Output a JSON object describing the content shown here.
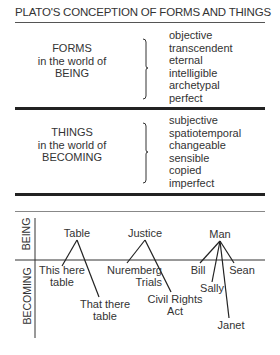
{
  "title": "PLATO'S CONCEPTION OF FORMS AND THINGS",
  "forms": {
    "label_lines": [
      "FORMS",
      "in the world of",
      "BEING"
    ],
    "attributes": [
      "objective",
      "transcendent",
      "eternal",
      "intelligible",
      "archetypal",
      "perfect"
    ]
  },
  "things": {
    "label_lines": [
      "THINGS",
      "in the world of",
      "BECOMING"
    ],
    "attributes": [
      "subjective",
      "spatiotemporal",
      "changeable",
      "sensible",
      "copied",
      "imperfect"
    ]
  },
  "tree": {
    "axis_top": "BEING",
    "axis_bottom": "BECOMING",
    "forms": [
      {
        "label": "Table",
        "instances": [
          [
            "This here",
            "table"
          ],
          [
            "That there",
            "table"
          ]
        ]
      },
      {
        "label": "Justice",
        "instances": [
          [
            "Nuremberg",
            "Trials"
          ],
          [
            "Civil Rights",
            "Act"
          ]
        ]
      },
      {
        "label": "Man",
        "instances": [
          [
            "Bill"
          ],
          [
            "Sally"
          ],
          [
            "Sean"
          ],
          [
            "Janet"
          ]
        ]
      }
    ]
  },
  "colors": {
    "text": "#333333",
    "rule": "#222222",
    "thin_rule": "#888888"
  }
}
